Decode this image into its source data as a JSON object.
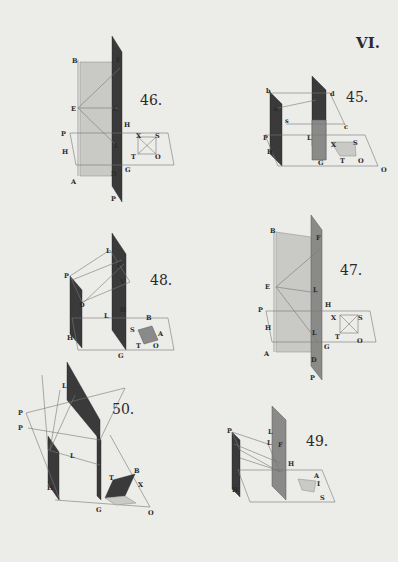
{
  "plate_number": "VI.",
  "figures": [
    {
      "number": "46.",
      "labels": [
        "B",
        "F",
        "E",
        "C",
        "H",
        "P",
        "H",
        "L",
        "D",
        "G",
        "A",
        "P",
        "X",
        "S",
        "T",
        "O"
      ]
    },
    {
      "number": "45.",
      "labels": [
        "b",
        "d",
        "n",
        "s",
        "c",
        "P",
        "L",
        "H",
        "G",
        "X",
        "S",
        "T",
        "O",
        "O"
      ]
    },
    {
      "number": "48.",
      "labels": [
        "L",
        "P",
        "F",
        "V",
        "D",
        "L",
        "H",
        "B",
        "S",
        "A",
        "H",
        "T",
        "O",
        "G"
      ]
    },
    {
      "number": "47.",
      "labels": [
        "B",
        "F",
        "E",
        "L",
        "H",
        "P",
        "X",
        "S",
        "H",
        "L",
        "T",
        "O",
        "G",
        "A",
        "D",
        "P"
      ]
    },
    {
      "number": "50.",
      "labels": [
        "L",
        "P",
        "P",
        "L",
        "B",
        "T",
        "X",
        "H",
        "G",
        "O"
      ]
    },
    {
      "number": "49.",
      "labels": [
        "P",
        "L",
        "L",
        "F",
        "H",
        "H",
        "A",
        "I",
        "S"
      ]
    }
  ]
}
